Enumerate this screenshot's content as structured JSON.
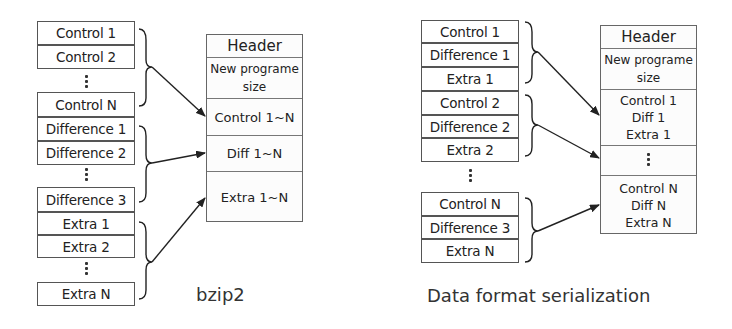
{
  "bzip2": {
    "caption": "bzip2",
    "left_blocks": [
      {
        "label": "Control 1"
      },
      {
        "label": "Control 2"
      },
      {
        "label": "Control N"
      },
      {
        "label": "Difference 1"
      },
      {
        "label": "Difference 2"
      },
      {
        "label": "Difference 3"
      },
      {
        "label": "Extra 1"
      },
      {
        "label": "Extra 2"
      },
      {
        "label": "Extra N"
      }
    ],
    "ellipsis": "⋮",
    "file": {
      "header": "Header",
      "size_line1": "New programe",
      "size_line2": "size",
      "control": "Control 1~N",
      "diff": "Diff 1~N",
      "extra": "Extra 1~N"
    }
  },
  "serialization": {
    "caption": "Data format serialization",
    "left_blocks": [
      {
        "label": "Control 1"
      },
      {
        "label": "Difference 1"
      },
      {
        "label": "Extra 1"
      },
      {
        "label": "Control 2"
      },
      {
        "label": "Difference 2"
      },
      {
        "label": "Extra 2"
      },
      {
        "label": "Control N"
      },
      {
        "label": "Difference 3"
      },
      {
        "label": "Extra N"
      }
    ],
    "file": {
      "header": "Header",
      "size_line1": "New programe",
      "size_line2": "size",
      "group1": [
        "Control 1",
        "Diff 1",
        "Extra 1"
      ],
      "groupN": [
        "Control N",
        "Diff N",
        "Extra N"
      ]
    }
  }
}
